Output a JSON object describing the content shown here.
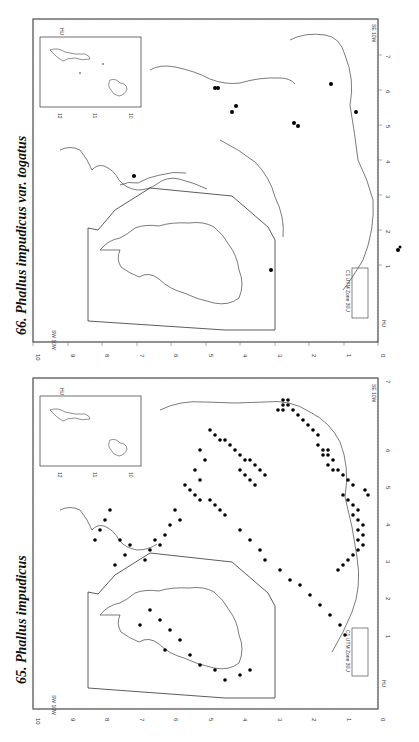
{
  "maps": [
    {
      "number": "66.",
      "title": "66. Phallus impudicus var. togatus",
      "species": "Phallus impudicus var. togatus",
      "x_ticks": [
        "10",
        "9",
        "8",
        "7",
        "6",
        "5",
        "4",
        "3",
        "2",
        "1",
        "0"
      ],
      "y_ticks": [
        "1",
        "2",
        "3",
        "4",
        "5",
        "6",
        "7"
      ],
      "inset_top": {
        "labels": [
          "12",
          "11",
          "10",
          "4"
        ],
        "grid_label": "HU"
      },
      "inset_bottom": {
        "label": "C1 UTM Zone 30U",
        "ticks": [
          "55",
          "0"
        ],
        "grid_label": "HU"
      },
      "corner_labels": [
        "SW 10W",
        "NW 10W",
        "SE 10W"
      ]
    },
    {
      "number": "65.",
      "title": "65. Phallus impudicus",
      "species": "Phallus impudicus",
      "x_ticks": [
        "10",
        "9",
        "8",
        "7",
        "6",
        "5",
        "4",
        "3",
        "2",
        "1",
        "0"
      ],
      "y_ticks": [
        "1",
        "2",
        "3",
        "4",
        "5",
        "6",
        "7"
      ],
      "inset_top": {
        "labels": [
          "12",
          "11",
          "10",
          "4"
        ],
        "grid_label": "HU"
      },
      "inset_bottom": {
        "label": "C1 UTM Zone 30U",
        "ticks": [
          "55",
          "0"
        ],
        "grid_label": "HU"
      },
      "corner_labels": [
        "SW 10W",
        "NW 10W",
        "SE 10W"
      ]
    }
  ],
  "colors": {
    "ink": "#111111",
    "background": "#ffffff",
    "dot": "#000000"
  }
}
